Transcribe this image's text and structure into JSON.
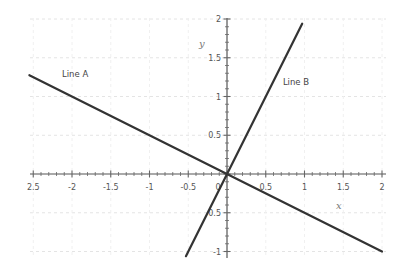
{
  "chart_data": {
    "type": "line",
    "title": "",
    "xlabel": "x",
    "ylabel": "y",
    "xlim": [
      -2.5,
      2
    ],
    "ylim": [
      -1,
      2
    ],
    "grid": true,
    "x_ticks": [
      -2.5,
      -2,
      -1.5,
      -1,
      -0.5,
      0,
      0.5,
      1,
      1.5,
      2
    ],
    "x_tick_labels": [
      "2.5",
      "-2",
      "-1.5",
      "-1",
      "-0.5",
      "0",
      "0.5",
      "1",
      "1.5",
      "2"
    ],
    "y_ticks": [
      -1,
      -0.5,
      0.5,
      1,
      1.5,
      2
    ],
    "y_tick_labels": [
      "-1",
      "0.5",
      "0.5",
      "1",
      "1.5",
      "2"
    ],
    "series": [
      {
        "name": "Line A",
        "slope": -0.5,
        "intercept": 0,
        "x": [
          -2.55,
          2.0
        ],
        "y": [
          1.275,
          -1.0
        ],
        "color": "#333333"
      },
      {
        "name": "Line B",
        "slope": 2,
        "intercept": 0,
        "x": [
          -0.53,
          0.97
        ],
        "y": [
          -1.06,
          1.94
        ],
        "color": "#333333"
      }
    ],
    "annotations": [
      {
        "text": "Line A",
        "x": -2.0,
        "y": 1.25
      },
      {
        "text": "Line B",
        "x": 0.85,
        "y": 1.15
      }
    ]
  },
  "layout": {
    "origin_px": [
      227,
      174
    ],
    "px_per_unit": 77.5
  }
}
